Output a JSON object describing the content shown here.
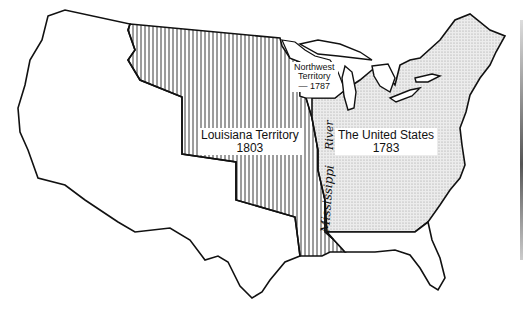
{
  "map": {
    "title": "Territorial expansion of the United States",
    "regions": [
      {
        "id": "united-states",
        "name": "The United States",
        "year": "1783",
        "fill": "stippled",
        "color": "#d9d9d9"
      },
      {
        "id": "louisiana",
        "name": "Louisiana Territory",
        "year": "1803",
        "fill": "vertical-hatch",
        "color": "#111111"
      },
      {
        "id": "northwest",
        "name": "Northwest Territory",
        "year": "1787",
        "fill": "white",
        "color": "#ffffff"
      },
      {
        "id": "west",
        "name": "",
        "year": "",
        "fill": "white",
        "color": "#ffffff"
      }
    ],
    "labels": {
      "northwest_line1": "Northwest",
      "northwest_line2": "Territory",
      "northwest_year": "— 1787",
      "louisiana_name": "Louisiana Territory",
      "louisiana_year": "1803",
      "us_name": "The United States",
      "us_year": "1783",
      "river_part1": "River",
      "river_part2": "Mississippi"
    },
    "colors": {
      "outline": "#111111",
      "stipple": "#bdbdbd",
      "hatch": "#222222",
      "background": "#ffffff"
    }
  }
}
